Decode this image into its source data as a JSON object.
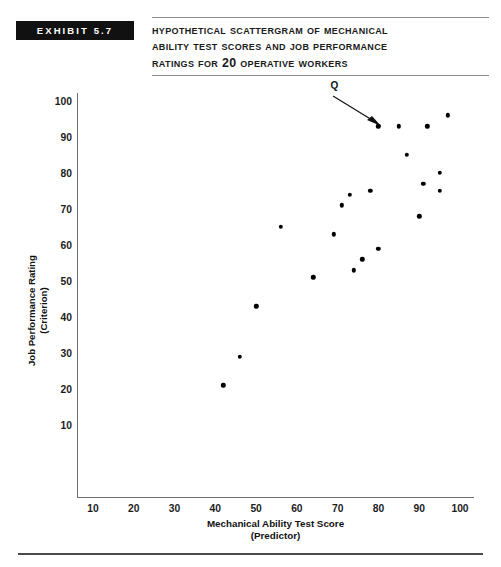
{
  "exhibit": {
    "badge_label": "EXHIBIT 5.7",
    "title_lines": [
      "Hypothetical Scattergram of Mechanical",
      "Ability Test Scores and Job Performance",
      "Ratings for 20 Operative Workers"
    ]
  },
  "colors": {
    "badge_background": "#111111",
    "badge_text": "#ffffff",
    "rule": "#8d8d8d",
    "axis": "#6e6e6e",
    "point": "#000000",
    "footer_rule": "#4a4a4a",
    "page_background": "#ffffff"
  },
  "annotation": {
    "label": "Q",
    "target_x": 80,
    "target_y": 93
  },
  "chart_data": {
    "type": "scatter",
    "title": "Hypothetical Scattergram of Mechanical Ability Test Scores and Job Performance Ratings for 20 Operative Workers",
    "xlabel": "Mechanical Ability Test Score",
    "xlabel_sub": "(Predictor)",
    "ylabel": "Job Performance Rating",
    "ylabel_sub": "(Criterion)",
    "xlim": [
      5,
      105
    ],
    "ylim": [
      0,
      103
    ],
    "xticks": [
      10,
      20,
      30,
      40,
      50,
      60,
      70,
      80,
      90,
      100
    ],
    "yticks": [
      10,
      20,
      30,
      40,
      50,
      60,
      70,
      80,
      90,
      100
    ],
    "grid": false,
    "legend": "none",
    "n_points": 20,
    "points": [
      {
        "x": 42,
        "y": 21
      },
      {
        "x": 46,
        "y": 29
      },
      {
        "x": 50,
        "y": 43
      },
      {
        "x": 56,
        "y": 65
      },
      {
        "x": 64,
        "y": 51
      },
      {
        "x": 69,
        "y": 63
      },
      {
        "x": 71,
        "y": 71
      },
      {
        "x": 73,
        "y": 74
      },
      {
        "x": 74,
        "y": 53
      },
      {
        "x": 76,
        "y": 56
      },
      {
        "x": 78,
        "y": 75
      },
      {
        "x": 80,
        "y": 59
      },
      {
        "x": 80,
        "y": 93
      },
      {
        "x": 85,
        "y": 93
      },
      {
        "x": 87,
        "y": 85
      },
      {
        "x": 90,
        "y": 68
      },
      {
        "x": 91,
        "y": 77
      },
      {
        "x": 92,
        "y": 93
      },
      {
        "x": 95,
        "y": 75
      },
      {
        "x": 95,
        "y": 80
      },
      {
        "x": 97,
        "y": 96
      }
    ]
  }
}
